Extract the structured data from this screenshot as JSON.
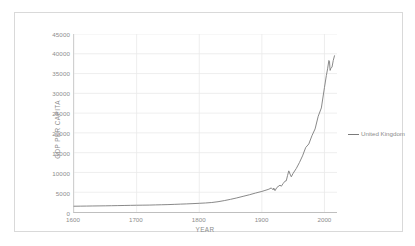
{
  "chart_data": {
    "type": "line",
    "title": "",
    "xlabel": "YEAR",
    "ylabel": "GDP PER CAPITA",
    "xlim": [
      1600,
      2020
    ],
    "ylim": [
      0,
      45000
    ],
    "grid": true,
    "legend_position": "right",
    "line_color": "#7b7b7b",
    "gridline_color": "#e9e9e9",
    "axis_text_color": "#8c8c8c",
    "xticks": [
      1600,
      1700,
      1800,
      1900,
      2000
    ],
    "xtick_labels": [
      "1600",
      "1700",
      "1800",
      "1900",
      "2000"
    ],
    "yticks": [
      0,
      5000,
      10000,
      15000,
      20000,
      25000,
      30000,
      35000,
      40000,
      45000
    ],
    "ytick_labels": [
      "0",
      "5000",
      "10000",
      "15000",
      "20000",
      "25000",
      "30000",
      "35000",
      "40000",
      "45000"
    ],
    "series": [
      {
        "name": "United Kingdom",
        "color": "#7b7b7b",
        "x": [
          1600,
          1610,
          1620,
          1630,
          1640,
          1650,
          1660,
          1670,
          1680,
          1690,
          1700,
          1710,
          1720,
          1730,
          1740,
          1750,
          1760,
          1770,
          1780,
          1790,
          1800,
          1810,
          1820,
          1830,
          1840,
          1850,
          1860,
          1870,
          1880,
          1890,
          1900,
          1905,
          1910,
          1913,
          1915,
          1918,
          1919,
          1921,
          1924,
          1929,
          1931,
          1934,
          1937,
          1939,
          1941,
          1943,
          1945,
          1947,
          1950,
          1955,
          1960,
          1965,
          1970,
          1975,
          1980,
          1985,
          1990,
          1995,
          2000,
          2003,
          2005,
          2007,
          2008,
          2009,
          2010,
          2012,
          2014,
          2016
        ],
        "y": [
          1460,
          1480,
          1500,
          1520,
          1540,
          1560,
          1590,
          1620,
          1650,
          1680,
          1710,
          1730,
          1750,
          1790,
          1830,
          1870,
          1930,
          1990,
          2050,
          2120,
          2200,
          2280,
          2400,
          2600,
          2880,
          3200,
          3560,
          3960,
          4350,
          4800,
          5200,
          5450,
          5700,
          5900,
          6100,
          5600,
          6050,
          5400,
          6200,
          6800,
          6500,
          7200,
          7800,
          7900,
          9200,
          10400,
          9600,
          8900,
          9800,
          11000,
          12500,
          14200,
          16300,
          17200,
          19300,
          21000,
          24200,
          26300,
          31500,
          34500,
          36200,
          38300,
          38100,
          35800,
          36300,
          36600,
          38300,
          39500
        ]
      }
    ]
  },
  "legend": {
    "label": "United Kingdom"
  },
  "axes": {
    "x_title": "YEAR",
    "y_title": "GDP PER CAPITA"
  }
}
